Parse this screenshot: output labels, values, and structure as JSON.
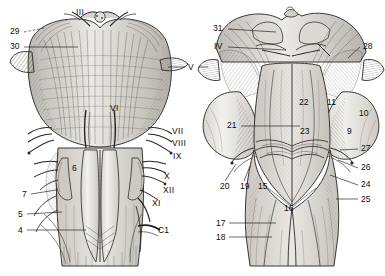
{
  "figure": {
    "background_color": "#ffffff",
    "ink_color": "#1a1a1a",
    "fill_light": "#e7e5e1",
    "fill_mid": "#cfccc6",
    "fill_dark": "#a9a5a0"
  },
  "panels": [
    {
      "id": "left",
      "name": "anterior-view"
    },
    {
      "id": "right",
      "name": "posterior-view"
    }
  ],
  "labels_left": [
    {
      "text": "III",
      "x": 76,
      "y": 8,
      "leader": "none"
    },
    {
      "text": "29",
      "x": 10,
      "y": 31,
      "leader": "dash-right"
    },
    {
      "text": "30",
      "x": 10,
      "y": 46,
      "leader": "line-right"
    },
    {
      "text": "VI",
      "x": 110,
      "y": 108,
      "leader": "none"
    },
    {
      "text": "VII",
      "x": 172,
      "y": 131,
      "leader": "none"
    },
    {
      "text": "VIII",
      "x": 172,
      "y": 142,
      "leader": "none"
    },
    {
      "text": "IX",
      "x": 172,
      "y": 155,
      "leader": "none"
    },
    {
      "text": "X",
      "x": 163,
      "y": 176,
      "leader": "none"
    },
    {
      "text": "XII",
      "x": 163,
      "y": 190,
      "leader": "none"
    },
    {
      "text": "XI",
      "x": 152,
      "y": 202,
      "leader": "none"
    },
    {
      "text": "6",
      "x": 72,
      "y": 168,
      "leader": "none"
    },
    {
      "text": "7",
      "x": 22,
      "y": 193,
      "leader": "line-right"
    },
    {
      "text": "5",
      "x": 18,
      "y": 213,
      "leader": "line-right"
    },
    {
      "text": "4",
      "x": 18,
      "y": 229,
      "leader": "line-right"
    },
    {
      "text": "C1",
      "x": 157,
      "y": 230,
      "leader": "none"
    }
  ],
  "labels_center": [
    {
      "text": "V",
      "x": 188,
      "y": 67,
      "leader": "both"
    }
  ],
  "labels_right": [
    {
      "text": "31",
      "x": 213,
      "y": 28,
      "leader": "line-right"
    },
    {
      "text": "IV",
      "x": 213,
      "y": 46,
      "leader": "line-right"
    },
    {
      "text": "28",
      "x": 362,
      "y": 46,
      "leader": "line-left"
    },
    {
      "text": "22",
      "x": 299,
      "y": 102,
      "leader": "none"
    },
    {
      "text": "11",
      "x": 327,
      "y": 102,
      "leader": "none"
    },
    {
      "text": "10",
      "x": 359,
      "y": 113,
      "leader": "none"
    },
    {
      "text": "21",
      "x": 227,
      "y": 125,
      "leader": "line-right"
    },
    {
      "text": "23",
      "x": 300,
      "y": 131,
      "leader": "none"
    },
    {
      "text": "9",
      "x": 345,
      "y": 131,
      "leader": "none"
    },
    {
      "text": "27",
      "x": 360,
      "y": 148,
      "leader": "line-left"
    },
    {
      "text": "26",
      "x": 361,
      "y": 167,
      "leader": "line-left"
    },
    {
      "text": "20",
      "x": 221,
      "y": 186,
      "leader": "line-up"
    },
    {
      "text": "19",
      "x": 240,
      "y": 186,
      "leader": "line-up"
    },
    {
      "text": "15",
      "x": 258,
      "y": 186,
      "leader": "none"
    },
    {
      "text": "24",
      "x": 361,
      "y": 184,
      "leader": "line-left"
    },
    {
      "text": "25",
      "x": 361,
      "y": 198,
      "leader": "line-left"
    },
    {
      "text": "16",
      "x": 284,
      "y": 208,
      "leader": "none"
    },
    {
      "text": "17",
      "x": 216,
      "y": 222,
      "leader": "line-right"
    },
    {
      "text": "18",
      "x": 216,
      "y": 236,
      "leader": "line-right"
    }
  ]
}
